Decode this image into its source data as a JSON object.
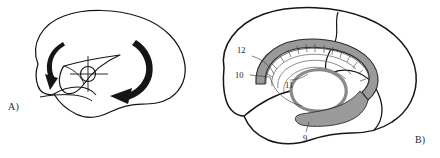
{
  "figure": {
    "type": "anatomical-line-drawing",
    "background_color": "#ffffff",
    "stroke_color": "#151515",
    "gray_fill_color": "#9a9a9a",
    "gray_fill_light": "#c9c9c9",
    "panels": [
      {
        "id": "A",
        "letter": "A)",
        "name": "brain-rotation-diagram",
        "description": "Lateral brain hemisphere outline with two thick curved rotation arrows and a central crosshair pivot marker",
        "elements": [
          {
            "name": "brain-outline",
            "kind": "outline"
          },
          {
            "name": "insula-triangle",
            "kind": "outline"
          },
          {
            "name": "temporal-lobe-outline",
            "kind": "outline"
          },
          {
            "name": "rotation-arrow-left",
            "kind": "arrow",
            "direction": "down"
          },
          {
            "name": "rotation-arrow-right",
            "kind": "arrow",
            "direction": "down-left"
          },
          {
            "name": "crosshair-pivot",
            "kind": "marker"
          }
        ]
      },
      {
        "id": "B",
        "letter": "B)",
        "name": "brain-structures-diagram",
        "description": "Lateral brain hemisphere outline with a C-shaped gray band, concentric arcs, hatching and numeric leader labels",
        "elements": [
          {
            "name": "brain-outline",
            "kind": "outline"
          },
          {
            "name": "central-sulcus",
            "kind": "outline"
          },
          {
            "name": "lateral-fissure",
            "kind": "outline"
          },
          {
            "name": "c-shaped-gray-band",
            "kind": "filled-shape"
          },
          {
            "name": "concentric-arcs",
            "kind": "outline"
          },
          {
            "name": "hatch-marks",
            "kind": "texture"
          },
          {
            "name": "tail-structure",
            "kind": "filled-shape"
          }
        ],
        "labels": [
          {
            "id": "label-12",
            "text": "12",
            "x": 237,
            "y": 55
          },
          {
            "id": "label-10",
            "text": "10",
            "x": 235,
            "y": 74
          },
          {
            "id": "label-11",
            "text": "11",
            "x": 288,
            "y": 82
          },
          {
            "id": "label-9",
            "text": "9",
            "x": 306,
            "y": 128
          }
        ]
      }
    ]
  }
}
